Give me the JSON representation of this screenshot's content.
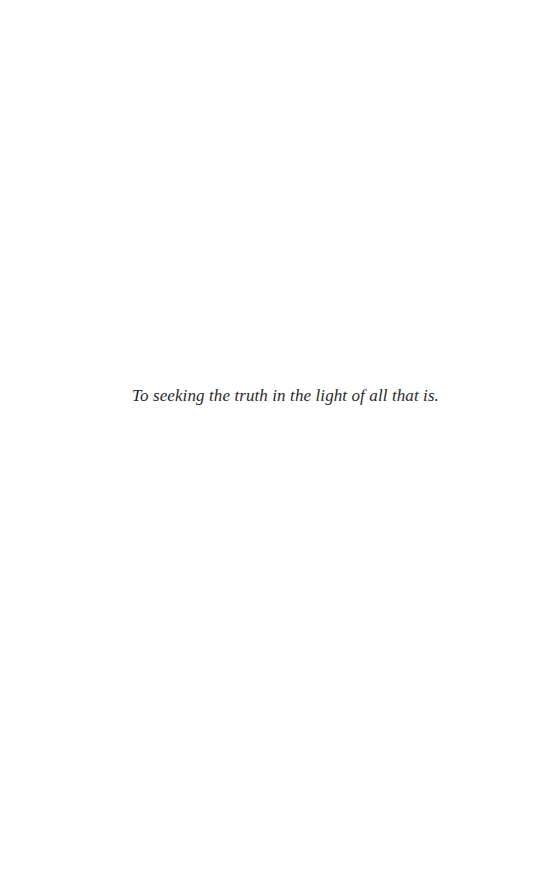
{
  "page": {
    "type": "dedication",
    "dedication_text": "To seeking the truth in the light of all that is."
  }
}
